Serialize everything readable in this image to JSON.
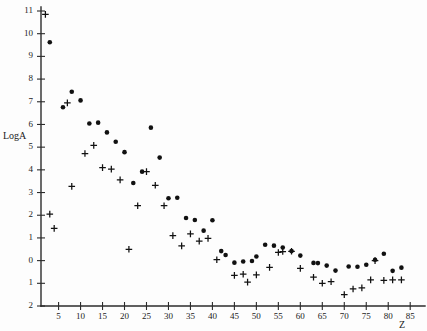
{
  "chart_data": {
    "type": "scatter",
    "title": "",
    "subtitle": "",
    "xlabel": "Z",
    "ylabel": "LogA",
    "xlim": [
      1,
      87
    ],
    "ylim": [
      -2,
      11
    ],
    "grid": false,
    "legend_position": "none",
    "annotations": [],
    "x_ticks": [
      5,
      10,
      15,
      20,
      25,
      30,
      35,
      40,
      45,
      50,
      55,
      60,
      65,
      70,
      75,
      80,
      85
    ],
    "x_tick_labels": [
      "5",
      "10",
      "15",
      "20",
      "25",
      "30",
      "35",
      "40",
      "45",
      "50",
      "55",
      "60",
      "65",
      "70",
      "75",
      "80",
      "85"
    ],
    "y_ticks": [
      11,
      10,
      9,
      8,
      7,
      6,
      5,
      4,
      3,
      2,
      1,
      0,
      -1,
      -2
    ],
    "y_tick_labels": [
      "11",
      "10",
      "9",
      "8",
      "7",
      "6",
      "5",
      "4",
      "3",
      "2",
      "1",
      "0",
      "1",
      "2"
    ],
    "series": [
      {
        "name": "dot-series",
        "marker": "filled-circle",
        "color": "#111111",
        "points": [
          [
            3,
            9.62
          ],
          [
            6,
            6.76
          ],
          [
            8,
            7.44
          ],
          [
            10,
            7.06
          ],
          [
            12,
            6.04
          ],
          [
            14,
            6.08
          ],
          [
            16,
            5.65
          ],
          [
            18,
            5.24
          ],
          [
            20,
            4.78
          ],
          [
            22,
            3.42
          ],
          [
            24,
            3.92
          ],
          [
            26,
            5.86
          ],
          [
            28,
            4.54
          ],
          [
            30,
            2.75
          ],
          [
            32,
            2.77
          ],
          [
            34,
            1.88
          ],
          [
            36,
            1.79
          ],
          [
            38,
            1.32
          ],
          [
            40,
            1.78
          ],
          [
            42,
            0.42
          ],
          [
            43,
            0.25
          ],
          [
            45,
            -0.09
          ],
          [
            47,
            -0.04
          ],
          [
            49,
            -0.02
          ],
          [
            50,
            0.18
          ],
          [
            52,
            0.7
          ],
          [
            54,
            0.66
          ],
          [
            56,
            0.58
          ],
          [
            58,
            0.42
          ],
          [
            60,
            0.22
          ],
          [
            63,
            -0.1
          ],
          [
            64,
            -0.11
          ],
          [
            66,
            -0.22
          ],
          [
            68,
            -0.44
          ],
          [
            71,
            -0.26
          ],
          [
            73,
            -0.27
          ],
          [
            75,
            -0.18
          ],
          [
            77,
            0.04
          ],
          [
            79,
            0.3
          ],
          [
            81,
            -0.45
          ],
          [
            83,
            -0.31
          ]
        ]
      },
      {
        "name": "plus-series",
        "marker": "plus",
        "color": "#111111",
        "points": [
          [
            2,
            10.85
          ],
          [
            3,
            2.05
          ],
          [
            4,
            1.42
          ],
          [
            7,
            6.95
          ],
          [
            8,
            3.27
          ],
          [
            11,
            4.72
          ],
          [
            13,
            5.08
          ],
          [
            15,
            4.1
          ],
          [
            17,
            4.03
          ],
          [
            19,
            3.56
          ],
          [
            21,
            0.5
          ],
          [
            23,
            2.42
          ],
          [
            25,
            3.92
          ],
          [
            27,
            3.32
          ],
          [
            29,
            2.42
          ],
          [
            31,
            1.1
          ],
          [
            33,
            0.65
          ],
          [
            35,
            1.18
          ],
          [
            37,
            0.86
          ],
          [
            39,
            0.98
          ],
          [
            41,
            0.04
          ],
          [
            45,
            -0.65
          ],
          [
            47,
            -0.6
          ],
          [
            48,
            -0.95
          ],
          [
            50,
            -0.63
          ],
          [
            53,
            -0.3
          ],
          [
            55,
            0.36
          ],
          [
            56,
            0.4
          ],
          [
            58,
            0.41
          ],
          [
            60,
            -0.34
          ],
          [
            63,
            -0.73
          ],
          [
            65,
            -1.0
          ],
          [
            67,
            -0.93
          ],
          [
            70,
            -1.5
          ],
          [
            72,
            -1.25
          ],
          [
            74,
            -1.2
          ],
          [
            76,
            -0.85
          ],
          [
            77,
            0.0
          ],
          [
            79,
            -0.87
          ],
          [
            81,
            -0.85
          ],
          [
            83,
            -0.85
          ]
        ]
      }
    ]
  },
  "figure": {
    "axis_color": "#2b2b2b",
    "marker_color": "#111111",
    "background": "#fdfdfd"
  }
}
